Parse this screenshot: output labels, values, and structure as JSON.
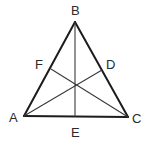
{
  "diagram": {
    "type": "triangle-medians",
    "colors": {
      "edge": "#1c1c1c",
      "median": "#3a3a3a",
      "label": "#2a2a2a",
      "background": "#ffffff"
    },
    "vertices": {
      "A": {
        "label": "A",
        "x": 24,
        "y": 116
      },
      "B": {
        "label": "B",
        "x": 75,
        "y": 22
      },
      "C": {
        "label": "C",
        "x": 128,
        "y": 117
      }
    },
    "midpoints": {
      "D": {
        "label": "D",
        "on": "BC",
        "x": 102,
        "y": 70
      },
      "E": {
        "label": "E",
        "on": "AC",
        "x": 75,
        "y": 117
      },
      "F": {
        "label": "F",
        "on": "AB",
        "x": 51,
        "y": 69
      }
    },
    "segments": [
      {
        "from": "A",
        "to": "B",
        "kind": "side"
      },
      {
        "from": "B",
        "to": "C",
        "kind": "side"
      },
      {
        "from": "A",
        "to": "C",
        "kind": "side"
      },
      {
        "from": "B",
        "to": "E",
        "kind": "median"
      },
      {
        "from": "A",
        "to": "D",
        "kind": "median"
      },
      {
        "from": "C",
        "to": "F",
        "kind": "median"
      }
    ],
    "labels": [
      {
        "text": "B",
        "x": 71,
        "y": 15
      },
      {
        "text": "A",
        "x": 9,
        "y": 122
      },
      {
        "text": "C",
        "x": 132,
        "y": 123
      },
      {
        "text": "E",
        "x": 71,
        "y": 137
      },
      {
        "text": "F",
        "x": 35,
        "y": 69
      },
      {
        "text": "D",
        "x": 106,
        "y": 69
      }
    ]
  }
}
